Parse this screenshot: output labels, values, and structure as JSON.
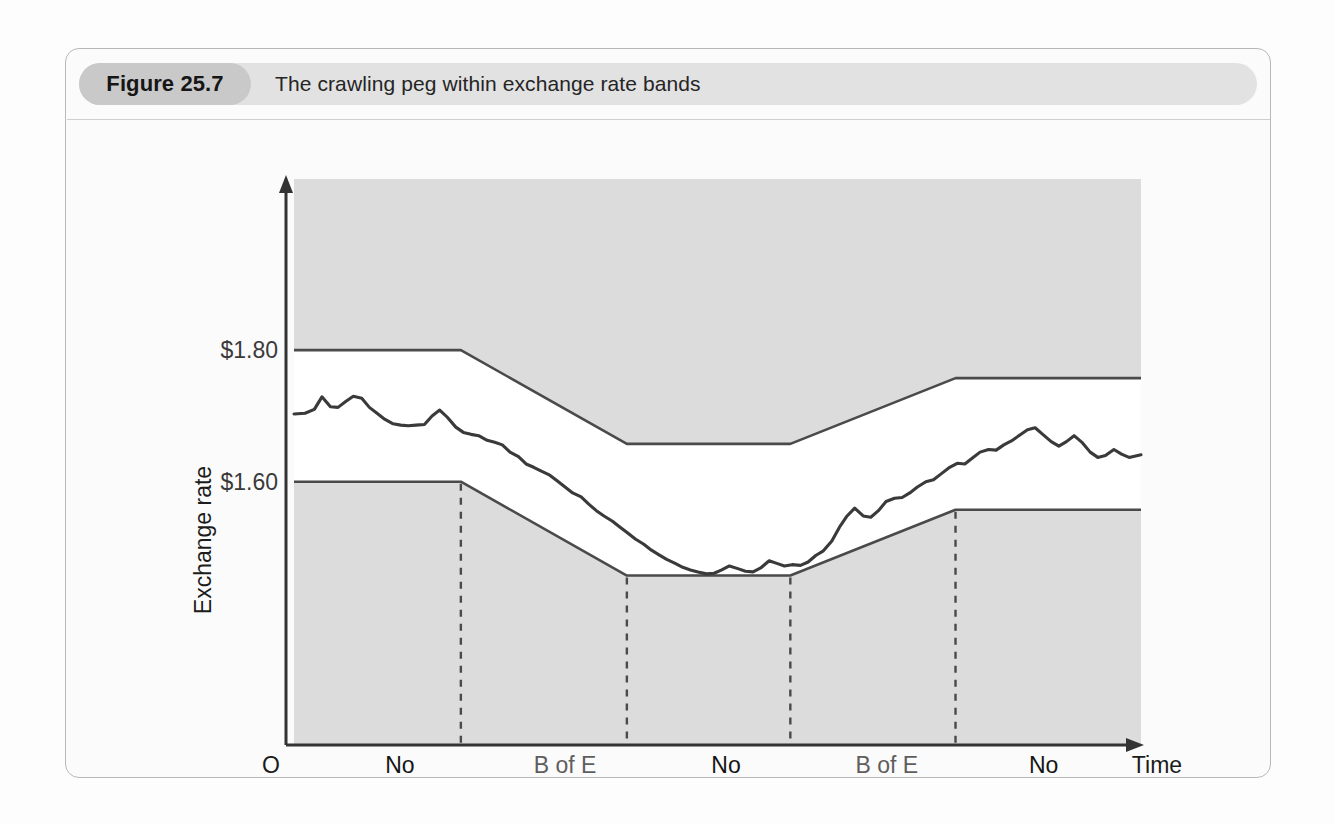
{
  "figure": {
    "number_label": "Figure 25.7",
    "title": "The crawling peg within exchange rate bands"
  },
  "colors": {
    "page_background": "#fdfdfd",
    "frame_border": "#b8b8b8",
    "caption_bar": "#e2e2e2",
    "badge": "#c9c9c9",
    "plot_shaded": "#dcdcdc",
    "band_fill": "#ffffff",
    "band_line": "#4a4a4a",
    "rate_line": "#3a3a3a",
    "axis": "#333333",
    "divider_dashed": "#4a4a4a"
  },
  "chart_data": {
    "type": "line",
    "title": "The crawling peg within exchange rate bands",
    "xlabel": "Time",
    "ylabel": "Exchange rate",
    "origin_label": "O",
    "grid": false,
    "legend": "none",
    "y_ticks": [
      {
        "label": "$1.80",
        "value": 1.8
      },
      {
        "label": "$1.60",
        "value": 1.6
      }
    ],
    "ylim": [
      1.2,
      2.06
    ],
    "xlim": [
      0,
      100
    ],
    "annotations": [
      {
        "label_line1": "No",
        "label_line2": "intervention",
        "style": "dark",
        "x_center": 12.5
      },
      {
        "label_line1": "B of E",
        "label_line2": "buys pounds",
        "style": "light",
        "x_center": 32.0
      },
      {
        "label_line1": "No",
        "label_line2": "intervention",
        "style": "dark",
        "x_center": 51.0
      },
      {
        "label_line1": "B of E",
        "label_line2": "sells pounds",
        "style": "light",
        "x_center": 70.0
      },
      {
        "label_line1": "No",
        "label_line2": "intervention",
        "style": "dark",
        "x_center": 88.5
      }
    ],
    "phase_dividers_x": [
      19.7,
      39.3,
      58.6,
      78.1
    ],
    "series": [
      {
        "name": "Upper band limit",
        "kind": "band_upper",
        "x": [
          0,
          19.7,
          39.3,
          58.6,
          78.1,
          100
        ],
        "y": [
          1.8,
          1.8,
          1.6575,
          1.6575,
          1.7575,
          1.7575
        ]
      },
      {
        "name": "Lower band limit",
        "kind": "band_lower",
        "x": [
          0,
          19.7,
          39.3,
          58.6,
          78.1,
          100
        ],
        "y": [
          1.6,
          1.6,
          1.4575,
          1.4575,
          1.5575,
          1.5575
        ]
      },
      {
        "name": "Market exchange rate",
        "kind": "rate",
        "x": [
          0.0,
          1.3,
          2.4,
          3.3,
          4.3,
          5.2,
          6.1,
          7.0,
          8.0,
          8.9,
          9.8,
          10.7,
          11.7,
          12.6,
          13.5,
          14.4,
          15.4,
          16.3,
          17.2,
          18.1,
          19.1,
          20.0,
          20.9,
          21.8,
          22.8,
          23.7,
          24.6,
          25.5,
          26.5,
          27.4,
          28.3,
          29.2,
          30.2,
          31.1,
          32.0,
          32.9,
          33.9,
          34.8,
          35.7,
          36.6,
          37.6,
          38.5,
          39.4,
          40.3,
          41.3,
          42.2,
          43.1,
          44.0,
          45.0,
          45.9,
          46.8,
          47.7,
          48.7,
          49.6,
          50.5,
          51.4,
          52.4,
          53.3,
          54.2,
          55.1,
          56.1,
          57.0,
          57.9,
          58.8,
          59.8,
          60.7,
          61.6,
          62.5,
          63.5,
          64.4,
          65.3,
          66.2,
          67.2,
          68.1,
          69.0,
          69.9,
          70.9,
          71.8,
          72.7,
          73.6,
          74.6,
          75.5,
          76.4,
          77.3,
          78.3,
          79.2,
          80.1,
          81.0,
          82.0,
          82.9,
          83.8,
          84.7,
          85.7,
          86.6,
          87.5,
          88.4,
          89.4,
          90.3,
          91.2,
          92.1,
          93.1,
          94.0,
          94.9,
          95.8,
          96.8,
          97.7,
          98.6,
          100.0
        ],
        "y": [
          1.703,
          1.704,
          1.71,
          1.729,
          1.714,
          1.713,
          1.722,
          1.73,
          1.727,
          1.713,
          1.704,
          1.695,
          1.688,
          1.686,
          1.685,
          1.686,
          1.687,
          1.7,
          1.709,
          1.698,
          1.683,
          1.675,
          1.672,
          1.67,
          1.663,
          1.66,
          1.656,
          1.645,
          1.638,
          1.627,
          1.622,
          1.616,
          1.61,
          1.601,
          1.592,
          1.583,
          1.577,
          1.566,
          1.556,
          1.548,
          1.54,
          1.531,
          1.522,
          1.513,
          1.505,
          1.496,
          1.489,
          1.482,
          1.476,
          1.47,
          1.466,
          1.463,
          1.46,
          1.461,
          1.466,
          1.472,
          1.468,
          1.464,
          1.463,
          1.469,
          1.48,
          1.476,
          1.472,
          1.474,
          1.473,
          1.478,
          1.488,
          1.495,
          1.51,
          1.531,
          1.548,
          1.56,
          1.548,
          1.546,
          1.556,
          1.57,
          1.575,
          1.576,
          1.583,
          1.592,
          1.6,
          1.603,
          1.612,
          1.621,
          1.628,
          1.627,
          1.636,
          1.645,
          1.649,
          1.648,
          1.656,
          1.662,
          1.671,
          1.679,
          1.682,
          1.672,
          1.661,
          1.654,
          1.661,
          1.67,
          1.659,
          1.645,
          1.637,
          1.64,
          1.649,
          1.642,
          1.637,
          1.641
        ]
      }
    ]
  },
  "axis": {
    "x_arrow_label": "Time",
    "y_axis_label": "Exchange rate",
    "origin": "O"
  }
}
